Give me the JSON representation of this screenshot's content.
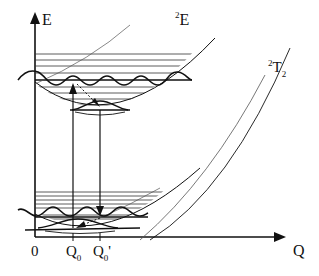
{
  "diagram": {
    "type": "configurational-coordinate-diagram",
    "axes": {
      "y_label": "E",
      "x_label": "Q",
      "origin_label": "0",
      "x_ticks": [
        {
          "label_main": "Q",
          "label_sub": "0",
          "label_suffix": ""
        },
        {
          "label_main": "Q",
          "label_sub": "0",
          "label_suffix": "'"
        }
      ]
    },
    "states": [
      {
        "name": "upper-state",
        "label_sup": "2",
        "label_main": "E",
        "label_sub": ""
      },
      {
        "name": "excited-state",
        "label_sup": "2",
        "label_main": "T",
        "label_sub": "2"
      }
    ],
    "transitions": [
      {
        "kind": "absorption",
        "from": "lower-well",
        "to": "upper-well",
        "at": "Q0",
        "style": "solid-arrow-up"
      },
      {
        "kind": "relaxation",
        "from": "upper-well-high",
        "to": "upper-well-min",
        "style": "dashed-arrow"
      },
      {
        "kind": "emission",
        "from": "upper-well",
        "to": "lower-well",
        "at": "Q0'",
        "style": "solid-arrow-down"
      },
      {
        "kind": "relaxation",
        "from": "lower-well-high",
        "to": "lower-well-min",
        "style": "dashed-arrow"
      }
    ],
    "colors": {
      "line": "#111111",
      "thin_line": "#333333",
      "background": "#ffffff"
    }
  }
}
